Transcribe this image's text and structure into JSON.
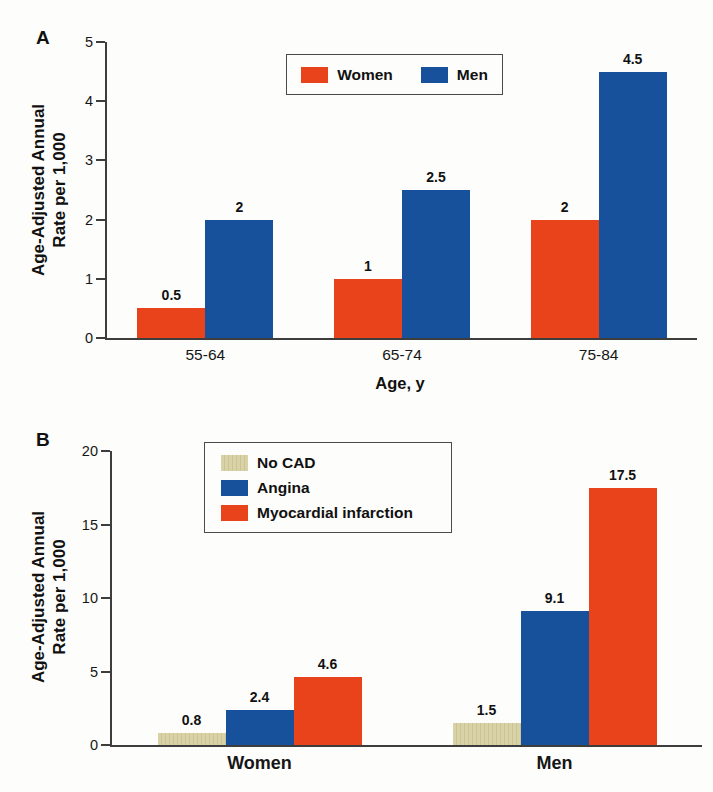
{
  "figure": {
    "background": "#fdfdfb"
  },
  "colors": {
    "axis": "#3d3d3d",
    "text": "#111111",
    "legend_border": "#4a4a4a"
  },
  "chart_data": [
    {
      "panel": "A",
      "type": "bar",
      "categories": [
        "55-64",
        "65-74",
        "75-84"
      ],
      "series": [
        {
          "name": "Women",
          "color": "#e8431b",
          "values": [
            0.5,
            1,
            2
          ]
        },
        {
          "name": "Men",
          "color": "#17519b",
          "values": [
            2,
            2.5,
            4.5
          ]
        }
      ],
      "value_labels": [
        [
          "0.5",
          "2"
        ],
        [
          "1",
          "2.5"
        ],
        [
          "2",
          "4.5"
        ]
      ],
      "xlabel": "Age, y",
      "ylabel_lines": [
        "Age-Adjusted Annual",
        "Rate per 1,000"
      ],
      "ylabel": "Age-Adjusted Annual Rate per 1,000",
      "ylim": [
        0,
        5
      ],
      "yticks": [
        0,
        1,
        2,
        3,
        4,
        5
      ],
      "grid": false,
      "legend": {
        "position": "top-center",
        "orientation": "horizontal",
        "entries": [
          "Women",
          "Men"
        ]
      }
    },
    {
      "panel": "B",
      "type": "bar",
      "categories": [
        "Women",
        "Men"
      ],
      "series": [
        {
          "name": "No CAD",
          "color": "#d9d2a6",
          "values": [
            0.8,
            1.5
          ],
          "textured": true
        },
        {
          "name": "Angina",
          "color": "#17519b",
          "values": [
            2.4,
            9.1
          ]
        },
        {
          "name": "Myocardial infarction",
          "color": "#e8431b",
          "values": [
            4.6,
            17.5
          ]
        }
      ],
      "value_labels": [
        [
          "0.8",
          "2.4",
          "4.6"
        ],
        [
          "1.5",
          "9.1",
          "17.5"
        ]
      ],
      "xlabel": "",
      "ylabel_lines": [
        "Age-Adjusted Annual",
        "Rate per 1,000"
      ],
      "ylabel": "Age-Adjusted Annual Rate per 1,000",
      "ylim": [
        0,
        20
      ],
      "yticks": [
        0,
        5,
        10,
        15,
        20
      ],
      "grid": false,
      "legend": {
        "position": "top-left",
        "orientation": "vertical",
        "entries": [
          "No CAD",
          "Angina",
          "Myocardial infarction"
        ]
      }
    }
  ]
}
